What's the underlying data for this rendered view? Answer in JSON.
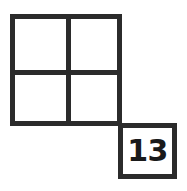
{
  "figure": {
    "background_color": "#ffffff",
    "stroke_color": "#2b2b2b",
    "text_color": "#1a1a1a",
    "grid": {
      "rows": 2,
      "columns": 2,
      "cells": [
        {
          "id": "top-left",
          "label": ""
        },
        {
          "id": "top-right",
          "label": ""
        },
        {
          "id": "bottom-left",
          "label": ""
        },
        {
          "id": "bottom-right",
          "label": ""
        }
      ]
    },
    "detached_square": {
      "id": "numbered-square",
      "label": "13",
      "position": "diagonal-bottom-right"
    }
  }
}
